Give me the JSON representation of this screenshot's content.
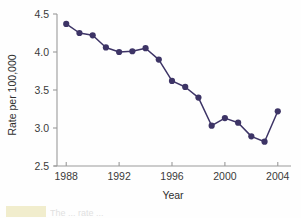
{
  "figure": {
    "background_color": "#fefefe",
    "caption_fragment": "The ... rate ...",
    "caption_highlight_color": "#efeac4"
  },
  "chart_data": {
    "type": "line",
    "title": "",
    "xlabel": "Year",
    "ylabel": "Rate per 100,000",
    "xlim": [
      1987,
      2005
    ],
    "ylim": [
      2.5,
      4.5
    ],
    "xticks": [
      1988,
      1992,
      1996,
      2000,
      2004
    ],
    "xtick_labels": [
      "1988",
      "1992",
      "1996",
      "2000",
      "2004"
    ],
    "yticks": [
      2.5,
      3.0,
      3.5,
      4.0,
      4.5
    ],
    "ytick_labels": [
      "2.5",
      "3.0",
      "3.5",
      "4.0",
      "4.5"
    ],
    "grid": false,
    "legend": false,
    "legend_position": "none",
    "marker": "circle",
    "marker_color": "#3d3466",
    "line_color": "#3d3466",
    "x": [
      1988,
      1989,
      1990,
      1991,
      1992,
      1993,
      1994,
      1995,
      1996,
      1997,
      1998,
      1999,
      2000,
      2001,
      2002,
      2003,
      2004
    ],
    "values": [
      4.37,
      4.25,
      4.22,
      4.06,
      4.0,
      4.01,
      4.05,
      3.9,
      3.62,
      3.54,
      3.4,
      3.03,
      3.13,
      3.07,
      2.89,
      2.82,
      3.22
    ],
    "series": [
      {
        "name": "Rate per 100,000",
        "values": [
          4.37,
          4.25,
          4.22,
          4.06,
          4.0,
          4.01,
          4.05,
          3.9,
          3.62,
          3.54,
          3.4,
          3.03,
          3.13,
          3.07,
          2.89,
          2.82,
          3.22
        ]
      }
    ]
  }
}
